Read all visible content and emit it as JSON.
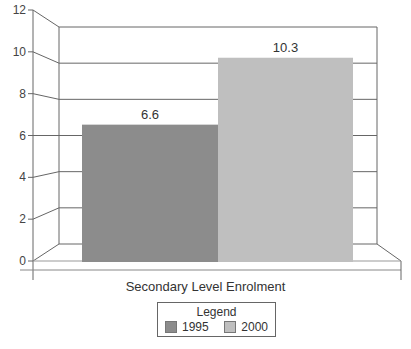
{
  "chart_data": {
    "type": "bar",
    "style": "3d",
    "title": "",
    "xlabel": "Secondary Level Enrolment",
    "ylabel": "",
    "categories": [
      "Secondary Level Enrolment"
    ],
    "series": [
      {
        "name": "1995",
        "values": [
          6.6
        ],
        "color": "#8c8c8c"
      },
      {
        "name": "2000",
        "values": [
          10.3
        ],
        "color": "#bfbfbf"
      }
    ],
    "data_labels": [
      "6.6",
      "10.3"
    ],
    "ylim": [
      0,
      12
    ],
    "yticks": [
      0,
      2,
      4,
      6,
      8,
      10,
      12
    ],
    "ytick_labels": [
      "0",
      "2",
      "4",
      "6",
      "8",
      "10",
      "12"
    ],
    "grid": true,
    "legend": {
      "title": "Legend",
      "position": "bottom",
      "entries": [
        "1995",
        "2000"
      ]
    }
  },
  "axis": {
    "xlabel": "Secondary Level Enrolment"
  },
  "legend": {
    "title": "Legend",
    "items": [
      {
        "label": "1995",
        "color": "#8c8c8c"
      },
      {
        "label": "2000",
        "color": "#bfbfbf"
      }
    ]
  }
}
